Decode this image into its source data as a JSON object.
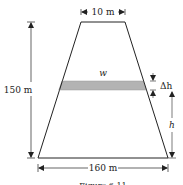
{
  "figure": {
    "top_width_label": "10 m",
    "bottom_width_label": "160 m",
    "height_label": "150 m",
    "strip_width_label": "w",
    "strip_thickness_label": "Δh",
    "strip_height_label": "h",
    "caption": "Figure 6.11"
  },
  "colors": {
    "outline": "#222222",
    "strip_fill": "#b3b3b3",
    "background": "#ffffff"
  }
}
